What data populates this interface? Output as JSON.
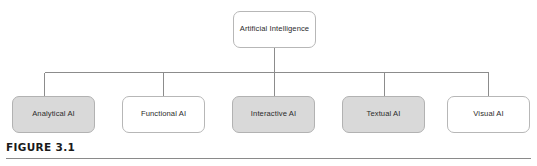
{
  "figure": {
    "caption": "FIGURE 3.1",
    "root": {
      "label": "Artificial Intelligence",
      "fill": "#ffffff"
    },
    "leaves": [
      {
        "label": "Analytical AI",
        "fill": "#d9d9d9",
        "filled": true
      },
      {
        "label": "Functional AI",
        "fill": "#ffffff",
        "filled": false
      },
      {
        "label": "Interactive AI",
        "fill": "#d9d9d9",
        "filled": true
      },
      {
        "label": "Textual AI",
        "fill": "#d9d9d9",
        "filled": true
      },
      {
        "label": "Visual AI",
        "fill": "#ffffff",
        "filled": false
      }
    ],
    "colors": {
      "box_border": "#b7b7b7",
      "box_fill_gray": "#d9d9d9",
      "box_fill_white": "#ffffff",
      "connector": "#8c8c8c",
      "caption_rule": "#8a8a8a",
      "text": "#2b2b2b",
      "background": "#ffffff"
    }
  }
}
